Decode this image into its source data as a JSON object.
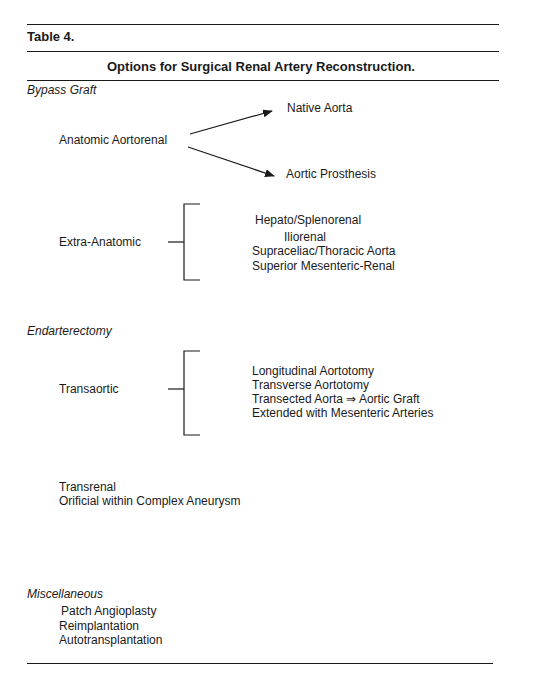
{
  "table": {
    "label": "Table 4.",
    "title": "Options for Surgical Renal Artery Reconstruction."
  },
  "sections": [
    {
      "heading": "Bypass Graft",
      "groups": [
        {
          "name": "Anatomic Aortorenal",
          "connector": "arrows",
          "options": [
            "Native Aorta",
            "Aortic Prosthesis"
          ]
        },
        {
          "name": "Extra-Anatomic",
          "connector": "bracket",
          "options": [
            "Hepato/Splenorenal",
            "Iliorenal",
            "Supraceliac/Thoracic Aorta",
            "Superior Mesenteric-Renal"
          ]
        }
      ]
    },
    {
      "heading": "Endarterectomy",
      "groups": [
        {
          "name": "Transaortic",
          "connector": "bracket",
          "options": [
            "Longitudinal Aortotomy",
            "Transverse Aortotomy",
            "Transected Aorta ⇒ Aortic Graft",
            "Extended with Mesenteric Arteries"
          ]
        }
      ],
      "items": [
        "Transrenal",
        "Orificial within Complex Aneurysm"
      ]
    },
    {
      "heading": "Miscellaneous",
      "items": [
        "Patch Angioplasty",
        "Reimplantation",
        "Autotranspl­antation"
      ]
    }
  ]
}
